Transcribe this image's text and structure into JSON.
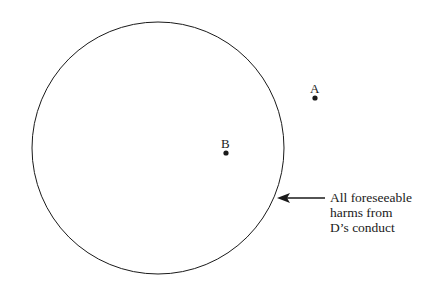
{
  "diagram": {
    "circle": {
      "label": "All foreseeable harms from D's conduct",
      "cx": 158,
      "cy": 148,
      "r": 126
    },
    "points": [
      {
        "label": "A",
        "x": 315,
        "y": 98
      },
      {
        "label": "B",
        "x": 226,
        "y": 153
      }
    ],
    "callout_lines": [
      "All foreseeable",
      "harms from",
      "D’s conduct"
    ],
    "colors": {
      "stroke": "#1a1a1a",
      "background": "#ffffff"
    }
  }
}
